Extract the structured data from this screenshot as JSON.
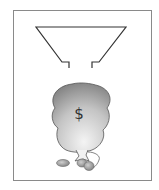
{
  "figure": {
    "bag_symbol": "$",
    "colors": {
      "frame": "#8a8a8a",
      "lines": "#333333",
      "bag_light": "#f2f2f2",
      "bag_dark": "#8c8c8c",
      "coin": "#9a9a9a"
    }
  }
}
